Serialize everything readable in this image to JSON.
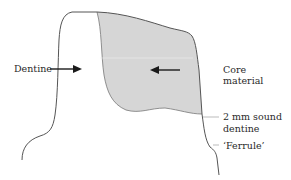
{
  "diagram": {
    "type": "tooth-crown-cross-section",
    "colors": {
      "outline": "#555555",
      "core_fill": "#d6d6d6",
      "arrow": "#1a1a1a",
      "leader": "#aaaaaa",
      "text": "#2a2a2a"
    },
    "labels": {
      "dentine": "Dentine",
      "core_line1": "Core",
      "core_line2": "material",
      "sound_line1": "2 mm sound",
      "sound_line2": "dentine",
      "ferrule": "‘Ferrule’"
    }
  }
}
